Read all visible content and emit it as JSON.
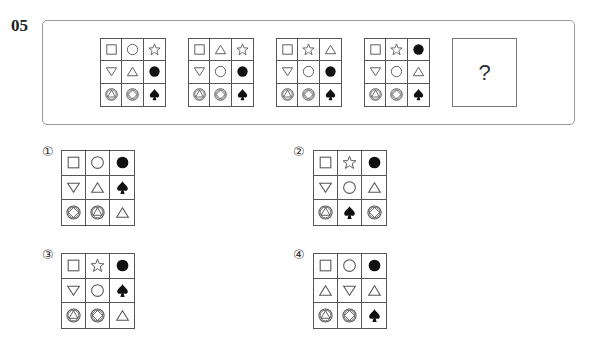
{
  "question": {
    "number": "05",
    "unknown_label": "?",
    "sequence": [
      {
        "cells": [
          "square",
          "circle",
          "star",
          "down-triangle",
          "up-triangle",
          "filled-circle",
          "circle-triangle",
          "circle-diamond",
          "spade"
        ]
      },
      {
        "cells": [
          "square",
          "up-triangle",
          "star",
          "down-triangle",
          "circle",
          "filled-circle",
          "circle-triangle",
          "circle-diamond",
          "spade"
        ]
      },
      {
        "cells": [
          "square",
          "star",
          "up-triangle",
          "down-triangle",
          "circle",
          "filled-circle",
          "circle-triangle",
          "circle-diamond",
          "spade"
        ]
      },
      {
        "cells": [
          "square",
          "star",
          "filled-circle",
          "down-triangle",
          "circle",
          "up-triangle",
          "circle-triangle",
          "circle-diamond",
          "spade"
        ]
      }
    ]
  },
  "options": [
    {
      "label": "①",
      "cells": [
        "square",
        "circle",
        "filled-circle",
        "down-triangle",
        "up-triangle",
        "spade",
        "circle-diamond",
        "circle-triangle",
        "up-triangle"
      ]
    },
    {
      "label": "②",
      "cells": [
        "square",
        "star",
        "filled-circle",
        "down-triangle",
        "circle",
        "up-triangle",
        "circle-triangle",
        "spade",
        "circle-diamond"
      ]
    },
    {
      "label": "③",
      "cells": [
        "square",
        "star",
        "filled-circle",
        "down-triangle",
        "circle",
        "spade",
        "circle-triangle",
        "circle-diamond",
        "up-triangle"
      ]
    },
    {
      "label": "④",
      "cells": [
        "square",
        "circle",
        "filled-circle",
        "up-triangle",
        "down-triangle",
        "up-triangle",
        "circle-triangle",
        "circle-diamond",
        "spade"
      ]
    }
  ],
  "colors": {
    "stroke": "#555555",
    "fill": "#111111",
    "frame": "#9a9a9a"
  }
}
